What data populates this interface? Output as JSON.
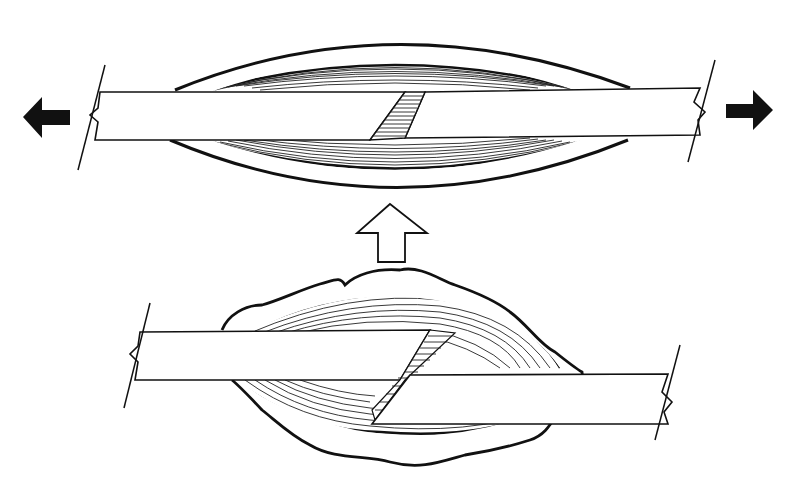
{
  "figure": {
    "caption_fragment": "",
    "colors": {
      "ink": "#111111",
      "background": "#ffffff"
    },
    "top_panel": {
      "name": "callus-under-tension",
      "left_arrow": "arrow-left-icon",
      "right_arrow": "arrow-right-icon",
      "fracture": "oblique"
    },
    "connector": {
      "icon": "arrow-up-outline-icon"
    },
    "bottom_panel": {
      "name": "displaced-fracture-with-hematoma",
      "fracture": "oblique displaced"
    }
  }
}
